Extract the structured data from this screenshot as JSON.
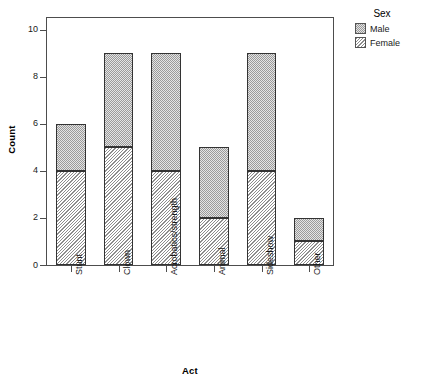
{
  "chart_data": {
    "type": "bar",
    "subtype": "stacked",
    "title": "",
    "xlabel": "Act",
    "ylabel": "Count",
    "categories": [
      "Stunt",
      "Clown",
      "Acrobatics/strength",
      "Animal",
      "Sideshow",
      "Other"
    ],
    "series": [
      {
        "name": "Female",
        "values": [
          4,
          5,
          4,
          2,
          4,
          1
        ],
        "pattern": "diagonal-hatch"
      },
      {
        "name": "Male",
        "values": [
          2,
          4,
          5,
          3,
          5,
          1
        ],
        "pattern": "dotted-stipple"
      }
    ],
    "stack_order": [
      "Female",
      "Male"
    ],
    "totals": [
      6,
      9,
      9,
      5,
      9,
      2
    ],
    "ylim": [
      0,
      10.5
    ],
    "yticks": [
      0,
      2,
      4,
      6,
      8,
      10
    ],
    "ytick_labels": [
      "0",
      "2",
      "4",
      "6",
      "8",
      "10"
    ],
    "grid": false,
    "legend": {
      "title": "Sex",
      "position": "right-top",
      "entries": [
        {
          "label": "Male",
          "pattern": "dotted-stipple"
        },
        {
          "label": "Female",
          "pattern": "diagonal-hatch"
        }
      ]
    },
    "colors": {
      "male_fill": "#e4e4e4",
      "male_dots": "#9a9a9a",
      "female_hatch": "#8d8d8d",
      "bar_border": "#333333",
      "frame": "#4d4d4d",
      "text": "#1a1a1a",
      "background": "#ffffff"
    },
    "axis_label_rotation_x": 90,
    "axis_label_rotation_y": 90
  }
}
